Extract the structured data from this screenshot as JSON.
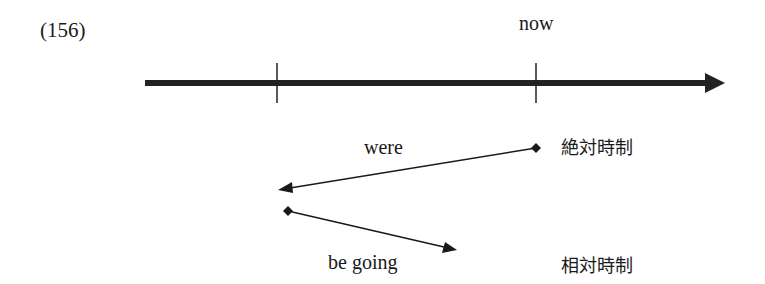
{
  "example_number": "(156)",
  "timeline": {
    "axis": {
      "x_start": 145,
      "x_end": 725,
      "y": 83,
      "color": "#222222",
      "thickness": 6
    },
    "ticks": [
      {
        "x": 277,
        "label": ""
      },
      {
        "x": 536,
        "label": "now"
      }
    ]
  },
  "labels": {
    "now": "now",
    "were": "were",
    "be_going": "be going",
    "absolute_tense": "絶対時制",
    "relative_tense": "相対時制"
  },
  "arrows": [
    {
      "name": "were-arrow",
      "from": [
        536,
        148
      ],
      "to": [
        279,
        190
      ],
      "label": "were"
    },
    {
      "name": "be-going-arrow",
      "from": [
        288,
        211
      ],
      "to": [
        456,
        250
      ],
      "label": "be going"
    }
  ]
}
